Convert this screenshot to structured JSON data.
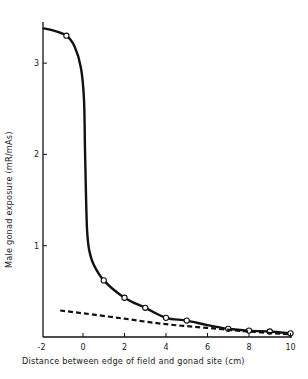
{
  "chart_data": {
    "type": "line",
    "title": "",
    "xlabel": "Distance between edge of field and gonad site (cm)",
    "ylabel": "Male gonad exposure (mR/mAs)",
    "xlim": [
      -2,
      10
    ],
    "ylim": [
      0,
      3.5
    ],
    "x_ticks": [
      -2,
      0,
      2,
      4,
      6,
      8,
      10
    ],
    "x_tick_labels": [
      "-2",
      "0",
      "2",
      "4",
      "6",
      "8",
      "10"
    ],
    "y_ticks": [
      1,
      2,
      3
    ],
    "y_tick_labels": [
      "1",
      "2",
      "3"
    ],
    "grid": false,
    "legend": null,
    "series": [
      {
        "name": "solid curve (open circles)",
        "style": "solid",
        "marker": "open-circle",
        "curve_x": [
          -1.9,
          -1.5,
          -0.8,
          -0.4,
          -0.1,
          0.05,
          0.1,
          0.15,
          0.2,
          0.3,
          0.5,
          1.0,
          2.0,
          3.0,
          4.0,
          5.0,
          6.0,
          7.0,
          8.0,
          9.0,
          10.0
        ],
        "curve_y": [
          3.38,
          3.36,
          3.3,
          3.18,
          2.95,
          2.6,
          2.0,
          1.5,
          1.15,
          0.95,
          0.8,
          0.62,
          0.43,
          0.32,
          0.21,
          0.18,
          0.13,
          0.09,
          0.07,
          0.06,
          0.04
        ],
        "points_x": [
          -0.8,
          1,
          2,
          3,
          4,
          5,
          7,
          8,
          9,
          10
        ],
        "points_y": [
          3.3,
          0.62,
          0.43,
          0.32,
          0.21,
          0.18,
          0.09,
          0.07,
          0.06,
          0.04
        ]
      },
      {
        "name": "dashed curve",
        "style": "dashed",
        "marker": "none",
        "x": [
          -1.1,
          0,
          2,
          4,
          6,
          8,
          10
        ],
        "y": [
          0.29,
          0.26,
          0.2,
          0.14,
          0.1,
          0.06,
          0.03
        ]
      }
    ]
  }
}
